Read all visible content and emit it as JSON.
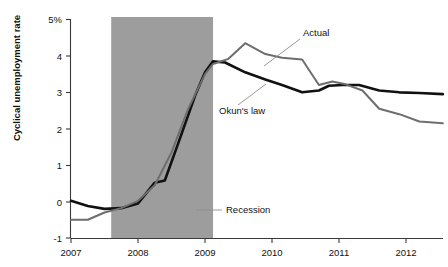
{
  "chart_data": {
    "type": "line",
    "title": "",
    "xlabel": "",
    "ylabel": "Cyclical unemployment rate",
    "xlim": [
      2007.0,
      2012.6
    ],
    "ylim": [
      -1,
      5
    ],
    "grid": false,
    "legend_position": "inline-annotations",
    "x_tick_labels": [
      "2007",
      "2008",
      "2009",
      "2010",
      "2011",
      "2012"
    ],
    "x_ticks": [
      2007,
      2008,
      2009,
      2010,
      2011,
      2012
    ],
    "y_tick_labels": [
      "5%",
      "4",
      "3",
      "2",
      "1",
      "0",
      "-1"
    ],
    "y_ticks": [
      5,
      4,
      3,
      2,
      1,
      0,
      -1
    ],
    "shaded_regions": [
      {
        "label": "Recession",
        "x_start": 2007.6,
        "x_end": 2009.12,
        "color": "#9d9d9d"
      }
    ],
    "annotations": [
      {
        "text": "Actual",
        "x": 303,
        "y": 33
      },
      {
        "text": "Okun's law",
        "x": 219,
        "y": 111
      },
      {
        "text": "Recession",
        "x": 226,
        "y": 213
      }
    ],
    "series": [
      {
        "name": "Okun's law",
        "color": "#111111",
        "line_width": 2.6,
        "x": [
          2007.0,
          2007.25,
          2007.5,
          2007.75,
          2008.0,
          2008.25,
          2008.4,
          2008.6,
          2008.85,
          2009.0,
          2009.12,
          2009.3,
          2009.6,
          2009.9,
          2010.15,
          2010.45,
          2010.7,
          2010.85,
          2011.05,
          2011.3,
          2011.6,
          2011.9,
          2012.2,
          2012.55
        ],
        "y": [
          0.02,
          -0.12,
          -0.2,
          -0.18,
          -0.05,
          0.52,
          0.58,
          1.6,
          2.9,
          3.55,
          3.85,
          3.82,
          3.55,
          3.35,
          3.2,
          3.0,
          3.05,
          3.18,
          3.2,
          3.2,
          3.05,
          3.0,
          2.98,
          2.95
        ]
      },
      {
        "name": "Actual",
        "color": "#6e6e6e",
        "line_width": 2.0,
        "x": [
          2007.0,
          2007.25,
          2007.5,
          2007.75,
          2008.0,
          2008.25,
          2008.5,
          2008.75,
          2009.0,
          2009.12,
          2009.35,
          2009.6,
          2009.9,
          2010.15,
          2010.45,
          2010.7,
          2010.9,
          2011.1,
          2011.35,
          2011.6,
          2011.9,
          2012.2,
          2012.55
        ],
        "y": [
          -0.5,
          -0.5,
          -0.3,
          -0.18,
          0.02,
          0.45,
          1.35,
          2.55,
          3.5,
          3.78,
          3.92,
          4.35,
          4.05,
          3.95,
          3.9,
          3.2,
          3.3,
          3.22,
          3.05,
          2.55,
          2.4,
          2.2,
          2.15
        ]
      }
    ]
  },
  "axis": {
    "y_title": "Cyclical unemployment rate"
  }
}
